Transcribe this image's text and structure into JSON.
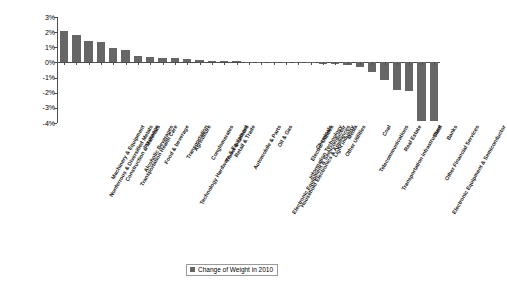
{
  "chart_data": {
    "type": "bar",
    "title": "",
    "xlabel": "",
    "ylabel": "",
    "ylim": [
      -4,
      3
    ],
    "ytick_labels": [
      "3%",
      "2%",
      "1%",
      "0%",
      "-1%",
      "-2%",
      "-3%",
      "-4%"
    ],
    "ytick_values": [
      3,
      2,
      1,
      0,
      -1,
      -2,
      -3,
      -4
    ],
    "grid": false,
    "legend_position": "bottom-center",
    "series_name": "Change of Weight in 2010",
    "bar_color": "#666666",
    "axis_color": "#4d4d4d",
    "categories": [
      "Nonferrous & Diversified Metals",
      "Machinery & Equipment",
      "Construction & Materials",
      "Transportation Health Care",
      "Alcoholic Beverages",
      "Insurance",
      "Food & beverage",
      "Technology Hardware & Equipment",
      "Transportation",
      "Agriculture",
      "Conglomerates",
      "Travel & Leisure",
      "Retail & Trade",
      "Automobile & Parts",
      "Electronic Equipment & Semiconductor",
      "Household Electronics & Appliances",
      "Oil & Gas",
      "Information Technology",
      "Electric Utilities",
      "Chemicals",
      "Light Industry",
      "Other Utilities",
      "Media",
      "Telecommunications",
      "Transportation Infrastructure",
      "Coal",
      "Real Estate",
      "Electronic Equipment & Semiconductor",
      "Other Financial Services",
      "Steel",
      "Banks"
    ],
    "values": [
      2.1,
      1.78,
      1.4,
      1.33,
      0.97,
      0.8,
      0.42,
      0.33,
      0.3,
      0.28,
      0.2,
      0.18,
      0.12,
      0.1,
      0.08,
      0.06,
      0.05,
      0.04,
      0.03,
      0.02,
      0.01,
      -0.1,
      -0.12,
      -0.18,
      -0.3,
      -0.65,
      -1.15,
      -1.8,
      -1.92,
      -3.9,
      -3.9
    ]
  },
  "legend": {
    "label": "Change of Weight in 2010"
  }
}
